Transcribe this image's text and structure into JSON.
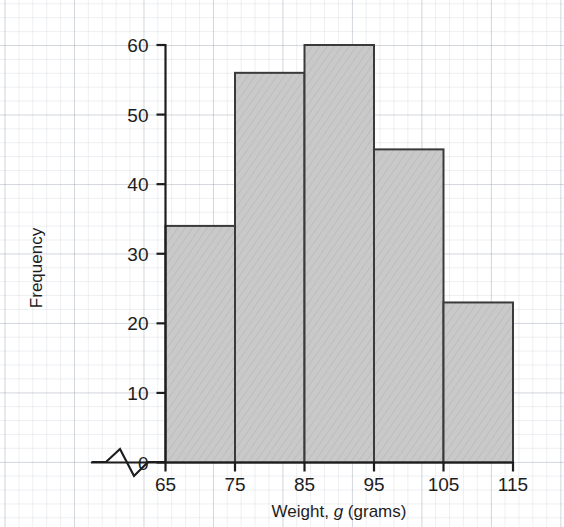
{
  "chart_data": {
    "type": "bar",
    "title": "",
    "subtitle": "",
    "xlabel_parts": {
      "pre": "Weight, ",
      "em": "g",
      "post": " (grams)"
    },
    "xlabel": "Weight, g (grams)",
    "ylabel": "Frequency",
    "categories": [
      "65-75",
      "75-85",
      "85-95",
      "95-105",
      "105-115"
    ],
    "bin_edges": [
      65,
      75,
      85,
      95,
      105,
      115
    ],
    "values": [
      34,
      56,
      60,
      45,
      23
    ],
    "x_ticks": [
      "65",
      "75",
      "85",
      "95",
      "105",
      "115"
    ],
    "x_tick_values": [
      65,
      75,
      85,
      95,
      105,
      115
    ],
    "y_ticks": [
      "0",
      "10",
      "20",
      "30",
      "40",
      "50",
      "60"
    ],
    "y_tick_values": [
      0,
      10,
      20,
      30,
      40,
      50,
      60
    ],
    "xlim": [
      65,
      115
    ],
    "ylim": [
      0,
      60
    ],
    "grid": true,
    "grid_style": "graph-paper",
    "legend": null,
    "axis_break": {
      "present": true,
      "axis": "x",
      "symbol": "zigzag"
    },
    "colors": {
      "bar_fill": "#c9c9c9",
      "bar_stroke": "#3a3a3a",
      "axis": "#1d1d1d",
      "text": "#1d1d1d",
      "grid_major": "#96a0af",
      "grid_minor": "#c4ccd6",
      "background": "#ffffff"
    }
  }
}
